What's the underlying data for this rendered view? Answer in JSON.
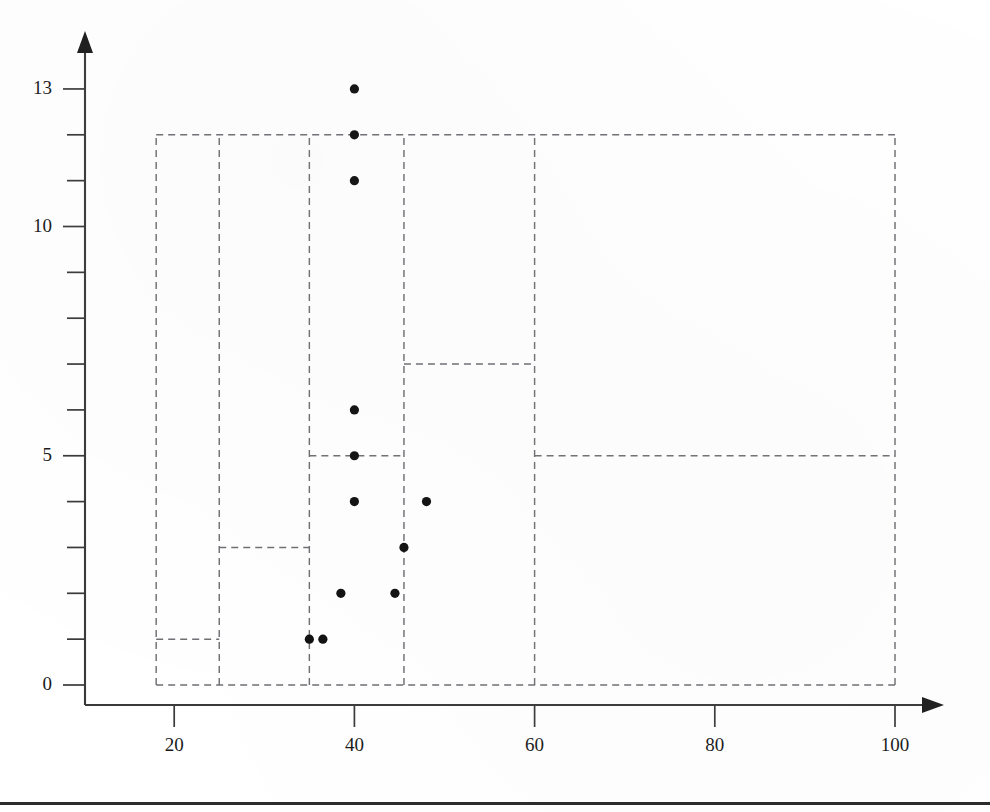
{
  "figure": {
    "background_color": "#ffffff",
    "axis_color": "#3a3a3a",
    "region_color": "#6f6f74",
    "point_color": "#101010"
  },
  "chart_data": {
    "type": "scatter",
    "title": "",
    "subtitle": "",
    "xlabel": "",
    "ylabel": "",
    "xlim": [
      10,
      105
    ],
    "ylim": [
      0,
      13.6
    ],
    "grid": false,
    "legend": null,
    "x_ticks": [
      20,
      40,
      60,
      80,
      100
    ],
    "x_tick_labels": [
      "20",
      "40",
      "60",
      "80",
      "100"
    ],
    "y_ticks": [
      0,
      1,
      2,
      3,
      4,
      5,
      6,
      7,
      8,
      9,
      10,
      11,
      12,
      13
    ],
    "y_tick_labels_shown": {
      "0": "0",
      "5": "5",
      "10": "10",
      "13": "13"
    },
    "y_labelled_ticks": [
      0,
      5,
      10,
      13
    ],
    "points": [
      {
        "x": 35.0,
        "y": 1
      },
      {
        "x": 36.5,
        "y": 1
      },
      {
        "x": 38.5,
        "y": 2
      },
      {
        "x": 44.5,
        "y": 2
      },
      {
        "x": 45.5,
        "y": 3
      },
      {
        "x": 40.0,
        "y": 4
      },
      {
        "x": 48.0,
        "y": 4
      },
      {
        "x": 40.0,
        "y": 5
      },
      {
        "x": 40.0,
        "y": 6
      },
      {
        "x": 40.0,
        "y": 11
      },
      {
        "x": 40.0,
        "y": 12
      },
      {
        "x": 40.0,
        "y": 13
      }
    ],
    "regions": [
      {
        "name": "outer-box",
        "x0": 18,
        "x1": 100,
        "y0": 0,
        "y1": 12
      },
      {
        "name": "box-left-narrow",
        "x0": 18,
        "x1": 25,
        "y0": 0,
        "y1": 12
      },
      {
        "name": "box-left-low",
        "x0": 18,
        "x1": 25,
        "y0": 0,
        "y1": 1
      },
      {
        "name": "box-mid-left",
        "x0": 25,
        "x1": 35,
        "y0": 0,
        "y1": 12
      },
      {
        "name": "box-mid-left-low",
        "x0": 25,
        "x1": 35,
        "y0": 0,
        "y1": 3
      },
      {
        "name": "box-mid",
        "x0": 35,
        "x1": 45.5,
        "y0": 0,
        "y1": 12
      },
      {
        "name": "box-mid-low",
        "x0": 35,
        "x1": 45.5,
        "y0": 0,
        "y1": 5
      },
      {
        "name": "box-mid-right",
        "x0": 45.5,
        "x1": 60,
        "y0": 0,
        "y1": 12
      },
      {
        "name": "box-mid-right-upper",
        "x0": 45.5,
        "x1": 60,
        "y0": 0,
        "y1": 7
      },
      {
        "name": "box-right",
        "x0": 60,
        "x1": 100,
        "y0": 0,
        "y1": 12
      },
      {
        "name": "box-right-low",
        "x0": 60,
        "x1": 100,
        "y0": 0,
        "y1": 5
      }
    ],
    "split_lines": [
      {
        "orientation": "horizontal",
        "y": 12,
        "x0": 18,
        "x1": 100
      },
      {
        "orientation": "horizontal",
        "y": 7,
        "x0": 45.5,
        "x1": 60
      },
      {
        "orientation": "horizontal",
        "y": 5,
        "x0": 35,
        "x1": 45.5
      },
      {
        "orientation": "horizontal",
        "y": 5,
        "x0": 60,
        "x1": 100
      },
      {
        "orientation": "horizontal",
        "y": 3,
        "x0": 25,
        "x1": 35
      },
      {
        "orientation": "horizontal",
        "y": 1,
        "x0": 18,
        "x1": 25
      },
      {
        "orientation": "horizontal",
        "y": 0,
        "x0": 18,
        "x1": 100
      },
      {
        "orientation": "vertical",
        "x": 18,
        "y0": 0,
        "y1": 12
      },
      {
        "orientation": "vertical",
        "x": 25,
        "y0": 0,
        "y1": 12
      },
      {
        "orientation": "vertical",
        "x": 35,
        "y0": 0,
        "y1": 12
      },
      {
        "orientation": "vertical",
        "x": 45.5,
        "y0": 0,
        "y1": 12
      },
      {
        "orientation": "vertical",
        "x": 60,
        "y0": 0,
        "y1": 12
      },
      {
        "orientation": "vertical",
        "x": 100,
        "y0": 0,
        "y1": 12
      }
    ]
  }
}
